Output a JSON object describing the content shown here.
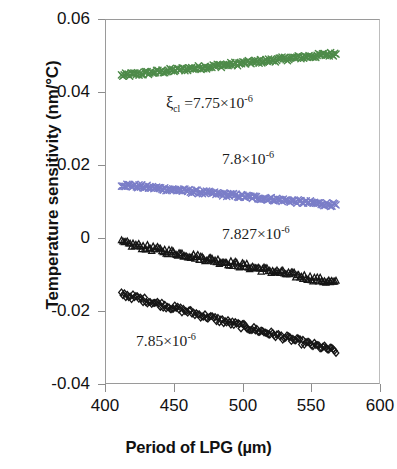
{
  "chart_data": {
    "type": "scatter",
    "title": "",
    "xlabel": "Period of LPG (µm)",
    "ylabel": "Temperature sensitivity (nm/°C)",
    "xlim": [
      400,
      600
    ],
    "ylim": [
      -0.04,
      0.06
    ],
    "xticks": [
      400,
      450,
      500,
      550,
      600
    ],
    "xticklabels": [
      "400",
      "450",
      "500",
      "550",
      "600"
    ],
    "yticks": [
      0.06,
      0.04,
      0.02,
      0,
      -0.02,
      -0.04
    ],
    "yticklabels": [
      "0.06",
      "0.04",
      "0.02",
      "0",
      "-0.02",
      "-0.04"
    ],
    "grid": false,
    "legend": "none",
    "annotations": [
      {
        "text": "ξ_cl =7.75×10⁻⁶",
        "x": 455,
        "y": 0.0318
      },
      {
        "text": "7.8×10⁻⁶",
        "x": 503,
        "y": 0.0205
      },
      {
        "text": "7.827×10⁻⁶",
        "x": 508,
        "y": 0.0005
      },
      {
        "text": "7.85×10⁻⁶",
        "x": 443,
        "y": -0.0268
      }
    ],
    "series": [
      {
        "name": "ξ_cl = 7.75×10⁻⁶",
        "label": "7.75×10⁻⁶",
        "marker": "x",
        "color": "#4e8b4a",
        "x_start": 412,
        "x_end": 568,
        "y_start": 0.0445,
        "y_end": 0.0505,
        "n_points": 160
      },
      {
        "name": "7.8×10⁻⁶",
        "label": "7.8×10⁻⁶",
        "marker": "x",
        "color": "#7b7ec8",
        "x_start": 412,
        "x_end": 568,
        "y_start": 0.0146,
        "y_end": 0.009,
        "n_points": 160
      },
      {
        "name": "7.827×10⁻⁶",
        "label": "7.827×10⁻⁶",
        "marker": "triangle",
        "color": "#161616",
        "x_start": 412,
        "x_end": 568,
        "y_start": -0.0013,
        "y_end": -0.0123,
        "n_points": 150
      },
      {
        "name": "7.85×10⁻⁶",
        "label": "7.85×10⁻⁶",
        "marker": "diamond",
        "color": "#161616",
        "x_start": 412,
        "x_end": 568,
        "y_start": -0.0153,
        "y_end": -0.031,
        "n_points": 150
      }
    ]
  },
  "axis": {
    "x_title": "Period of LPG (µm)",
    "y_title": "Temperature sensitivity (nm/°C)"
  },
  "annotation_text": {
    "s1_prefix": "ξ",
    "s1_sub": "cl",
    "s1_body": " =7.75×10",
    "s1_exp": "-6",
    "s2_body": "7.8×10",
    "s2_exp": "-6",
    "s3_body": "7.827×10",
    "s3_exp": "-6",
    "s4_body": "7.85×10",
    "s4_exp": "-6"
  },
  "colors": {
    "series1_green": "#4e8b4a",
    "series2_purple": "#7b7ec8",
    "series3_black": "#161616",
    "series4_black": "#161616",
    "axis_gray": "#8d8d8d",
    "text": "#111111"
  }
}
